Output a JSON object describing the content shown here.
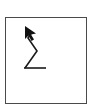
{
  "canvas": {
    "width": 94,
    "height": 112,
    "background_color": "#ffffff",
    "label": "Gesture stroke thumbnail"
  },
  "panel": {
    "label": "Gesture drawing panel",
    "x": 5,
    "y": 17,
    "width": 82,
    "height": 87,
    "fill_color": "#ffffff",
    "border_color": "#4a4a4a",
    "border_width": 1
  },
  "gesture": {
    "name": "zigzag-stroke",
    "description": "Z-shaped zigzag stroke with cursor arrowhead at upper end",
    "stroke_color": "#1a1a1a",
    "stroke_width": 1.6,
    "direction": "up-left",
    "points": [
      {
        "x": 19,
        "y": 50
      },
      {
        "x": 31,
        "y": 33
      },
      {
        "x": 22,
        "y": 20
      },
      {
        "x": 26,
        "y": 14
      }
    ],
    "arrowhead": {
      "name": "cursor-arrowhead",
      "tip_x": 19,
      "tip_y": 8,
      "fill_color": "#111111",
      "polygon": "19,8 19,22 23,18 27,24 30,22 26,17 31,16"
    }
  },
  "chart_data": {
    "type": "line",
    "xlabel": "",
    "ylabel": "",
    "x": [
      19,
      31,
      22,
      26
    ],
    "values": [
      50,
      33,
      20,
      14
    ],
    "series": [
      {
        "name": "stroke-path",
        "points": [
          {
            "x": 19,
            "y": 50
          },
          {
            "x": 31,
            "y": 33
          },
          {
            "x": 22,
            "y": 20
          },
          {
            "x": 26,
            "y": 14
          }
        ]
      }
    ],
    "annotations": [
      {
        "name": "arrow-terminator",
        "x": 19,
        "y": 8,
        "text": ""
      }
    ],
    "xlim": [
      0,
      82
    ],
    "ylim": [
      0,
      87
    ],
    "grid": false,
    "legend": "none"
  }
}
